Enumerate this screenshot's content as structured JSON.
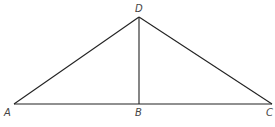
{
  "diagram": {
    "type": "geometry",
    "points": {
      "A": {
        "label": "A",
        "x": 14,
        "y": 104,
        "lx": 4,
        "ly": 116
      },
      "B": {
        "label": "B",
        "x": 139,
        "y": 104,
        "lx": 135,
        "ly": 116
      },
      "C": {
        "label": "C",
        "x": 272,
        "y": 104,
        "lx": 266,
        "ly": 116
      },
      "D": {
        "label": "D",
        "x": 139,
        "y": 17,
        "lx": 135,
        "ly": 12
      }
    },
    "segments": [
      {
        "from": "A",
        "to": "D"
      },
      {
        "from": "D",
        "to": "C"
      },
      {
        "from": "A",
        "to": "C"
      },
      {
        "from": "D",
        "to": "B"
      }
    ],
    "colors": {
      "line": "#222222",
      "label": "#444444"
    }
  }
}
